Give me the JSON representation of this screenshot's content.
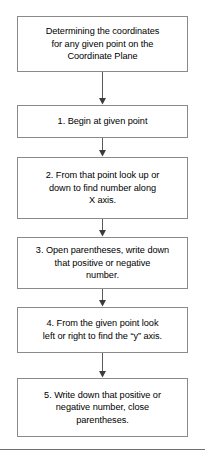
{
  "diagram": {
    "type": "flowchart",
    "orientation": "vertical",
    "background_color": "#ffffff",
    "box_border_color": "#8a8a8a",
    "connector_color": "#5a5a5a",
    "divider_color": "#6f6f6f",
    "nodes": [
      {
        "id": "title",
        "role": "title",
        "text": "Determining the coordinates for any given point on the Coordinate Plane",
        "lines": [
          "Determining the coordinates",
          "for any given point on the",
          "Coordinate Plane"
        ]
      },
      {
        "id": "step1",
        "role": "step",
        "number": "1",
        "text": "1. Begin at given point",
        "lines": [
          "1. Begin at given point"
        ]
      },
      {
        "id": "step2",
        "role": "step",
        "number": "2",
        "text": "2. From that point look up or down to find number along X axis.",
        "lines": [
          "2. From that point look up or",
          "down to find number along",
          "X axis."
        ]
      },
      {
        "id": "step3",
        "role": "step",
        "number": "3",
        "text": "3. Open parentheses, write down that positive or negative number.",
        "lines": [
          "3. Open parentheses, write down",
          "that positive or negative",
          "number."
        ]
      },
      {
        "id": "step4",
        "role": "step",
        "number": "4",
        "text": "4. From the given point look left or right to find the “y” axis.",
        "lines": [
          "4. From the given point look",
          "left or right to find the “y” axis."
        ]
      },
      {
        "id": "step5",
        "role": "step",
        "number": "5",
        "text": "5. Write down that positive or negative number, close parentheses.",
        "lines": [
          "5. Write down that positive or",
          "negative number, close",
          "parentheses."
        ]
      }
    ],
    "connectors": [
      {
        "id": "arrow-title-step1",
        "from": "title",
        "to": "step1"
      },
      {
        "id": "arrow-step1-step2",
        "from": "step1",
        "to": "step2"
      },
      {
        "id": "arrow-step2-step3",
        "from": "step2",
        "to": "step3"
      },
      {
        "id": "arrow-step3-step4",
        "from": "step3",
        "to": "step4"
      },
      {
        "id": "arrow-step4-step5",
        "from": "step4",
        "to": "step5"
      }
    ]
  }
}
